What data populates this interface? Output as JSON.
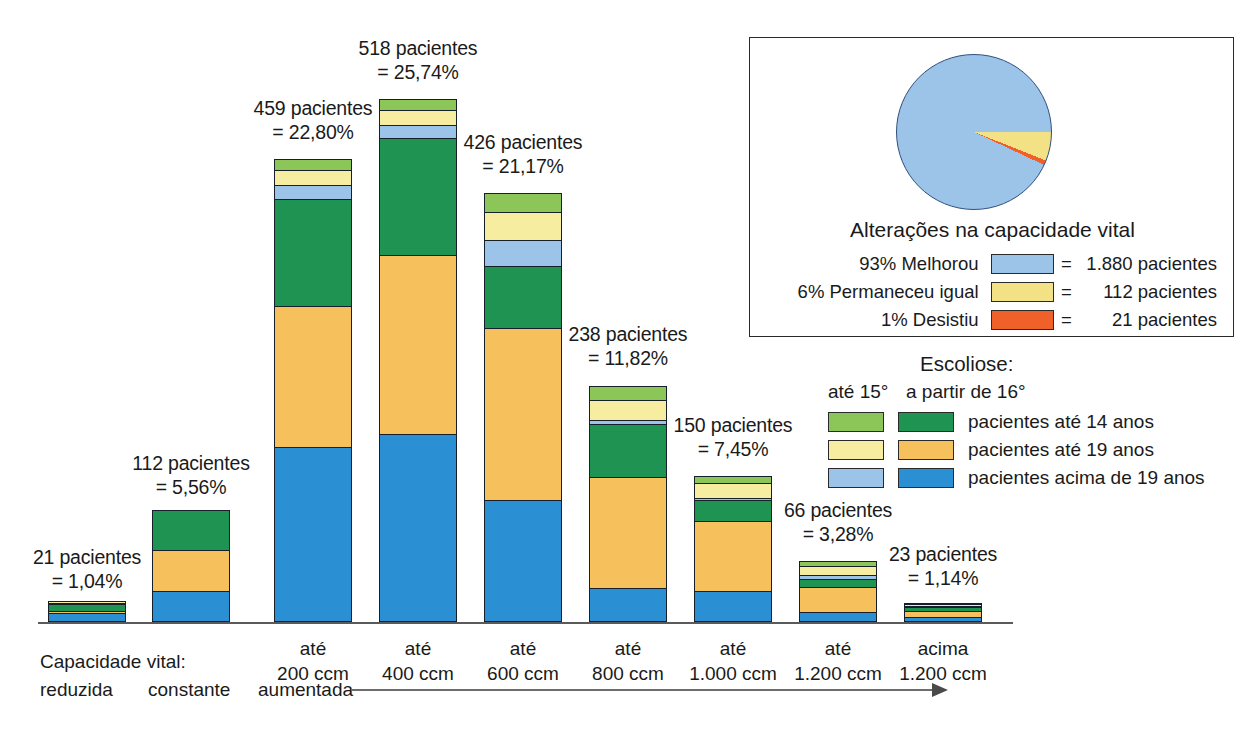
{
  "chart_data": {
    "type": "bar",
    "title": "",
    "xlabel": "Capacidade vital",
    "ylabel": "",
    "stacked": true,
    "grid": false,
    "legend_position": "right",
    "categories": [
      "reduzida",
      "constante",
      "até 200 ccm",
      "até 400 ccm",
      "até 600 ccm",
      "até 800 ccm",
      "até 1.000 ccm",
      "até 1.200 ccm",
      "acima 1.200 ccm"
    ],
    "totals": [
      21,
      112,
      459,
      518,
      426,
      238,
      150,
      66,
      23
    ],
    "total_percents": [
      "1,04%",
      "5,56%",
      "22,80%",
      "25,74%",
      "21,17%",
      "11,82%",
      "7,45%",
      "3,28%",
      "1,14%"
    ],
    "series": [
      {
        "name": "pacientes acima de 19 anos (a partir de 16°)",
        "color": "#2b8fd4",
        "values": [
          9,
          30,
          171,
          184,
          119,
          33,
          30,
          10,
          5
        ]
      },
      {
        "name": "pacientes até 19 anos (a partir de 16°)",
        "color": "#f6c15c",
        "values": [
          2,
          42,
          139,
          176,
          170,
          110,
          70,
          26,
          7
        ]
      },
      {
        "name": "pacientes até 14 anos (a partir de 16°)",
        "color": "#1f9351",
        "values": [
          8,
          40,
          106,
          116,
          62,
          53,
          22,
          9,
          5
        ]
      },
      {
        "name": "pacientes acima de 19 anos (até 15°)",
        "color": "#9cc3e8",
        "values": [
          1,
          0,
          15,
          14,
          26,
          6,
          3,
          5,
          2
        ]
      },
      {
        "name": "pacientes até 19 anos (até 15°)",
        "color": "#f6eda1",
        "values": [
          1,
          0,
          16,
          16,
          29,
          20,
          16,
          10,
          2
        ]
      },
      {
        "name": "pacientes até 14 anos (até 15°)",
        "color": "#8cc659",
        "values": [
          0,
          0,
          12,
          12,
          20,
          16,
          9,
          6,
          2
        ]
      }
    ],
    "bar_labels": [
      "21 pacientes\n= 1,04%",
      "112 pacientes\n= 5,56%",
      "459 pacientes\n= 22,80%",
      "518 pacientes\n= 25,74%",
      "426 pacientes\n= 21,17%",
      "238 pacientes\n= 11,82%",
      "150 pacientes\n= 7,45%",
      "66 pacientes\n= 3,28%",
      "23 pacientes\n= 1,14%"
    ],
    "x_tick_labels": [
      "",
      "",
      "até\n200 ccm",
      "até\n400 ccm",
      "até\n600 ccm",
      "até\n800 ccm",
      "até\n1.000 ccm",
      "até\n1.200 ccm",
      "acima\n1.200 ccm"
    ],
    "pie": {
      "type": "pie",
      "title": "Alterações na capacidade vital",
      "labels": [
        "93% Melhorou",
        "6% Permaneceu igual",
        "1% Desistiu"
      ],
      "values": [
        1880,
        112,
        21
      ],
      "percents": [
        93,
        6,
        1
      ],
      "value_texts": [
        "= 1.880 pacientes",
        "=   112 pacientes",
        "=    21 pacientes"
      ],
      "colors": [
        "#9cc3e8",
        "#f3e186",
        "#f0612a"
      ]
    }
  },
  "axis": {
    "vital_capacity_label": "Capacidade vital:",
    "reduced": "reduzida",
    "constant": "constante",
    "increased": "aumentada"
  },
  "pie_panel": {
    "title": "Alterações na capacidade vital",
    "rows": [
      {
        "label": "93% Melhorou",
        "eq": "=",
        "value": "1.880 pacientes",
        "color": "#9cc3e8"
      },
      {
        "label": "6% Permaneceu igual",
        "eq": "=",
        "value": "112 pacientes",
        "color": "#f3e186"
      },
      {
        "label": "1% Desistiu",
        "eq": "=",
        "value": "21 pacientes",
        "color": "#f0612a"
      }
    ]
  },
  "scoliosis_legend": {
    "title": "Escoliose:",
    "col1_head": "até 15°",
    "col2_head": "a partir de 16°",
    "rows": [
      {
        "light": "#8cc659",
        "dark": "#1f9351",
        "text": "pacientes até 14 anos"
      },
      {
        "light": "#f6eda1",
        "dark": "#f6c15c",
        "text": "pacientes até 19 anos"
      },
      {
        "light": "#9cc3e8",
        "dark": "#2b8fd4",
        "text": "pacientes acima de 19 anos"
      }
    ]
  },
  "caption": {
    "text": ""
  },
  "colors": {
    "light_green": "#8cc659",
    "dark_green": "#1f9351",
    "light_yellow": "#f6eda1",
    "orange": "#f6c15c",
    "light_blue": "#9cc3e8",
    "blue": "#2b8fd4",
    "pie_orange": "#f0612a",
    "outline": "#17202a"
  }
}
